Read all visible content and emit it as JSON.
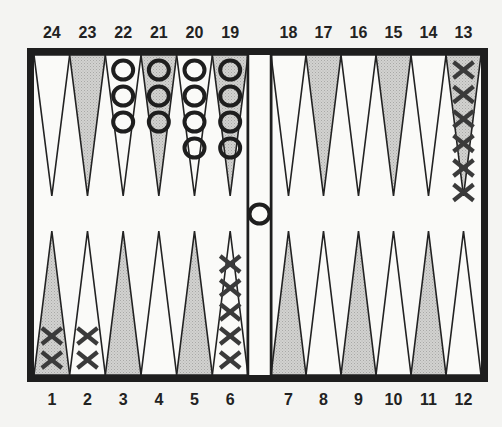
{
  "colors": {
    "background": "#f4f4f2",
    "frame": "#1e1e1e",
    "shaded_point": "#c8c8c8",
    "white_point": "#fafafa",
    "checker_o": "#1e1e1e",
    "checker_x": "#3a3a3a"
  },
  "top_labels": [
    "24",
    "23",
    "22",
    "21",
    "20",
    "19",
    "18",
    "17",
    "16",
    "15",
    "14",
    "13"
  ],
  "bottom_labels": [
    "1",
    "2",
    "3",
    "4",
    "5",
    "6",
    "7",
    "8",
    "9",
    "10",
    "11",
    "12"
  ],
  "points": [
    {
      "point": 1,
      "shaded": true,
      "checker": "X",
      "count": 2
    },
    {
      "point": 2,
      "shaded": false,
      "checker": "X",
      "count": 2
    },
    {
      "point": 3,
      "shaded": true,
      "checker": null,
      "count": 0
    },
    {
      "point": 4,
      "shaded": false,
      "checker": null,
      "count": 0
    },
    {
      "point": 5,
      "shaded": true,
      "checker": null,
      "count": 0
    },
    {
      "point": 6,
      "shaded": false,
      "checker": "X",
      "count": 5
    },
    {
      "point": 7,
      "shaded": true,
      "checker": null,
      "count": 0
    },
    {
      "point": 8,
      "shaded": false,
      "checker": null,
      "count": 0
    },
    {
      "point": 9,
      "shaded": true,
      "checker": null,
      "count": 0
    },
    {
      "point": 10,
      "shaded": false,
      "checker": null,
      "count": 0
    },
    {
      "point": 11,
      "shaded": true,
      "checker": null,
      "count": 0
    },
    {
      "point": 12,
      "shaded": false,
      "checker": null,
      "count": 0
    },
    {
      "point": 13,
      "shaded": true,
      "checker": "X",
      "count": 6
    },
    {
      "point": 14,
      "shaded": false,
      "checker": null,
      "count": 0
    },
    {
      "point": 15,
      "shaded": true,
      "checker": null,
      "count": 0
    },
    {
      "point": 16,
      "shaded": false,
      "checker": null,
      "count": 0
    },
    {
      "point": 17,
      "shaded": true,
      "checker": null,
      "count": 0
    },
    {
      "point": 18,
      "shaded": false,
      "checker": null,
      "count": 0
    },
    {
      "point": 19,
      "shaded": true,
      "checker": "O",
      "count": 4
    },
    {
      "point": 20,
      "shaded": false,
      "checker": "O",
      "count": 4
    },
    {
      "point": 21,
      "shaded": true,
      "checker": "O",
      "count": 3
    },
    {
      "point": 22,
      "shaded": false,
      "checker": "O",
      "count": 3
    },
    {
      "point": 23,
      "shaded": true,
      "checker": null,
      "count": 0
    },
    {
      "point": 24,
      "shaded": false,
      "checker": null,
      "count": 0
    }
  ],
  "bar": {
    "checker": "O",
    "count": 1
  }
}
